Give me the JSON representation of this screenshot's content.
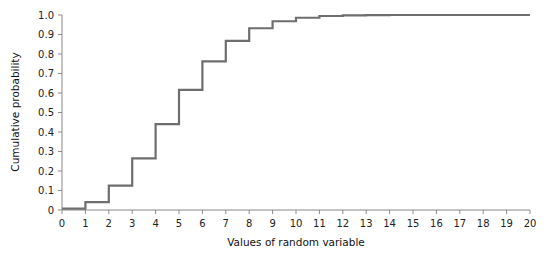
{
  "chart_data": {
    "type": "line",
    "subtype": "step",
    "title": "",
    "xlabel": "Values of random variable",
    "ylabel": "Cumulative probability",
    "xlim": [
      0,
      20
    ],
    "ylim": [
      0,
      1.0
    ],
    "grid": false,
    "legend": null,
    "x_ticks": [
      0,
      1,
      2,
      3,
      4,
      5,
      6,
      7,
      8,
      9,
      10,
      11,
      12,
      13,
      14,
      15,
      16,
      17,
      18,
      19,
      20
    ],
    "y_ticks": [
      "0",
      "0.1",
      "0.2",
      "0.3",
      "0.4",
      "0.5",
      "0.6",
      "0.7",
      "0.8",
      "0.9",
      "1.0"
    ],
    "series": [
      {
        "name": "Cumulative probability",
        "color": "#6e6e6e",
        "x": [
          0,
          1,
          2,
          3,
          4,
          5,
          6,
          7,
          8,
          9,
          10,
          11,
          12,
          13,
          14,
          15,
          16,
          17,
          18,
          19,
          20
        ],
        "values": [
          0.007,
          0.04,
          0.125,
          0.265,
          0.44,
          0.616,
          0.762,
          0.867,
          0.932,
          0.968,
          0.986,
          0.995,
          0.998,
          0.999,
          1.0,
          1.0,
          1.0,
          1.0,
          1.0,
          1.0,
          1.0
        ]
      }
    ]
  }
}
